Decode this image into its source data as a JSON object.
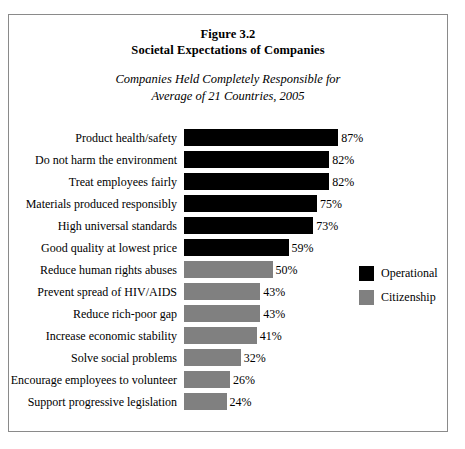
{
  "figure": {
    "title_line1": "Figure 3.2",
    "title_line2": "Societal Expectations of Companies",
    "subtitle_line1": "Companies Held Completely Responsible for",
    "subtitle_line2": "Average of 21 Countries, 2005"
  },
  "legend": {
    "items": [
      {
        "label": "Operational",
        "color": "#000000",
        "key": "operational"
      },
      {
        "label": "Citizenship",
        "color": "#808080",
        "key": "citizenship"
      }
    ]
  },
  "chart_data": {
    "type": "bar",
    "orientation": "horizontal",
    "subtitle": "Companies Held Completely Responsible for Average of 21 Countries, 2005",
    "xlabel": "",
    "ylabel": "",
    "xlim": [
      0,
      100
    ],
    "grid": false,
    "legend_position": "right",
    "value_suffix": "%",
    "categories": [
      "Product health/safety",
      "Do not harm the environment",
      "Treat employees fairly",
      "Materials produced responsibly",
      "High universal standards",
      "Good quality at lowest price",
      "Reduce human rights abuses",
      "Prevent spread of HIV/AIDS",
      "Reduce rich-poor gap",
      "Increase economic stability",
      "Solve social problems",
      "Encourage employees to volunteer",
      "Support progressive legislation"
    ],
    "values": [
      87,
      82,
      82,
      75,
      73,
      59,
      50,
      43,
      43,
      41,
      32,
      26,
      24
    ],
    "value_labels": [
      "87%",
      "82%",
      "82%",
      "75%",
      "73%",
      "59%",
      "50%",
      "43%",
      "43%",
      "41%",
      "32%",
      "26%",
      "24%"
    ],
    "series_keys": [
      "operational",
      "operational",
      "operational",
      "operational",
      "operational",
      "operational",
      "citizenship",
      "citizenship",
      "citizenship",
      "citizenship",
      "citizenship",
      "citizenship",
      "citizenship"
    ],
    "series": [
      {
        "name": "Operational",
        "color": "#000000"
      },
      {
        "name": "Citizenship",
        "color": "#808080"
      }
    ]
  }
}
